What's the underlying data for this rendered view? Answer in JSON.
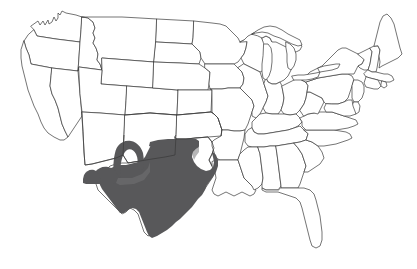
{
  "map": {
    "title": "United States outline map with highlighted region",
    "type": "choropleth-outline",
    "projection": "albers-usa-like",
    "background_color": "#ffffff",
    "outline_color": "#3a3a3a",
    "outline_width_px": 0.7,
    "width_px": 417,
    "height_px": 269,
    "labels_visible": false,
    "legend_visible": false,
    "title_visible": false,
    "highlight": {
      "color": "#58585a",
      "soft_color": "#6e6e70",
      "description": "Shaded area covering Texas, eastern and southern New Mexico, the Oklahoma panhandle vicinity, and the southeastern corner of Arizona",
      "states_fully_shaded": [
        "Texas"
      ],
      "states_partially_shaded": [
        "New Mexico",
        "Oklahoma",
        "Arizona"
      ],
      "states_unshaded": [
        "Washington",
        "Oregon",
        "California",
        "Nevada",
        "Idaho",
        "Montana",
        "Wyoming",
        "Utah",
        "Colorado",
        "North Dakota",
        "South Dakota",
        "Nebraska",
        "Kansas",
        "Minnesota",
        "Iowa",
        "Missouri",
        "Arkansas",
        "Louisiana",
        "Wisconsin",
        "Illinois",
        "Michigan",
        "Indiana",
        "Ohio",
        "Kentucky",
        "Tennessee",
        "Mississippi",
        "Alabama",
        "Georgia",
        "Florida",
        "South Carolina",
        "North Carolina",
        "Virginia",
        "West Virginia",
        "Maryland",
        "Delaware",
        "Pennsylvania",
        "New Jersey",
        "New York",
        "Connecticut",
        "Rhode Island",
        "Massachusetts",
        "Vermont",
        "New Hampshire",
        "Maine"
      ]
    },
    "features": {
      "great_lakes_outlined": true,
      "alaska_hawaii_shown": false,
      "state_borders_shown": true,
      "coastline_shown": true
    }
  }
}
